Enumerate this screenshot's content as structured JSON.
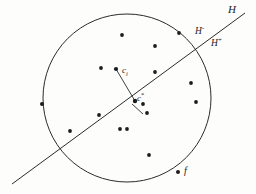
{
  "figure": {
    "background_color": "#fdfdfc",
    "ink_color": "#2b2b2b",
    "width": 256,
    "height": 194
  },
  "labels": {
    "hyperplane": "H",
    "halfspace_negative_base": "H",
    "halfspace_negative_sup": "-",
    "halfspace_positive_base": "H",
    "halfspace_positive_sup": "+",
    "center_i_base": "c",
    "center_i_sub": "i",
    "center_star_base": "c",
    "center_star_sup": "*",
    "facility": "f"
  },
  "geometry": {
    "circle": {
      "cx": 127,
      "cy": 98,
      "r": 84
    },
    "hyperplane_line": {
      "x1": 12,
      "y1": 184,
      "x2": 245,
      "y2": 13
    },
    "normal_segment": {
      "x1": 116,
      "y1": 69,
      "x2": 135,
      "y2": 101
    },
    "perp_tick": {
      "x1": 132,
      "y1": 104,
      "x2": 143,
      "y2": 114
    },
    "label_positions": {
      "hyperplane": {
        "x": 228,
        "y": 6
      },
      "halfspace_negative": {
        "x": 196,
        "y": 27
      },
      "halfspace_positive": {
        "x": 212,
        "y": 39
      },
      "center_i": {
        "x": 120,
        "y": 72
      },
      "center_star": {
        "x": 133,
        "y": 96
      },
      "facility": {
        "x": 183,
        "y": 168
      }
    }
  },
  "chart_data": {
    "type": "scatter",
    "xlabel": "",
    "ylabel": "",
    "xlim": [
      0,
      256
    ],
    "ylim": [
      0,
      194
    ],
    "grid": false,
    "legend": null,
    "annotations": [
      {
        "text": "H",
        "x": 228,
        "y": 6,
        "role": "hyperplane-label"
      },
      {
        "text": "H-",
        "x": 196,
        "y": 27,
        "role": "negative-halfspace-label"
      },
      {
        "text": "H+",
        "x": 212,
        "y": 39,
        "role": "positive-halfspace-label"
      },
      {
        "text": "ci",
        "x": 120,
        "y": 72,
        "role": "center-i-label"
      },
      {
        "text": "c*",
        "x": 133,
        "y": 96,
        "role": "optimal-center-label"
      },
      {
        "text": "f",
        "x": 183,
        "y": 168,
        "role": "facility-label"
      }
    ],
    "shapes": [
      {
        "kind": "circle",
        "cx": 127,
        "cy": 98,
        "r": 84,
        "filled": false
      },
      {
        "kind": "line",
        "x1": 12,
        "y1": 184,
        "x2": 245,
        "y2": 13,
        "name": "hyperplane"
      },
      {
        "kind": "line",
        "x1": 116,
        "y1": 69,
        "x2": 135,
        "y2": 101,
        "name": "normal-segment"
      },
      {
        "kind": "line",
        "x1": 132,
        "y1": 104,
        "x2": 143,
        "y2": 114,
        "name": "perpendicular-tick"
      }
    ],
    "points": [
      {
        "id": "p1",
        "x": 122,
        "y": 35,
        "r": 1.9
      },
      {
        "id": "p2",
        "x": 155,
        "y": 46,
        "r": 1.9
      },
      {
        "id": "p3",
        "x": 179,
        "y": 33,
        "r": 1.9
      },
      {
        "id": "p4",
        "x": 101,
        "y": 68,
        "r": 1.9
      },
      {
        "id": "p5",
        "x": 116,
        "y": 69,
        "r": 2.1
      },
      {
        "id": "p6",
        "x": 155,
        "y": 72,
        "r": 1.9
      },
      {
        "id": "p7",
        "x": 191,
        "y": 83,
        "r": 1.9
      },
      {
        "id": "p8",
        "x": 196,
        "y": 102,
        "r": 1.9
      },
      {
        "id": "p9",
        "x": 42,
        "y": 104,
        "r": 2.0
      },
      {
        "id": "p10",
        "x": 143,
        "y": 104,
        "r": 1.9
      },
      {
        "id": "p11",
        "x": 99,
        "y": 115,
        "r": 1.9
      },
      {
        "id": "p12",
        "x": 147,
        "y": 113,
        "r": 1.9
      },
      {
        "id": "p13",
        "x": 70,
        "y": 131,
        "r": 1.9
      },
      {
        "id": "p14",
        "x": 120,
        "y": 129,
        "r": 1.9
      },
      {
        "id": "p15",
        "x": 127,
        "y": 129,
        "r": 1.9
      },
      {
        "id": "p16",
        "x": 149,
        "y": 155,
        "r": 1.9
      },
      {
        "id": "p17",
        "x": 178,
        "y": 172,
        "r": 2.0
      },
      {
        "id": "p18",
        "x": 135,
        "y": 101,
        "r": 2.2
      }
    ]
  }
}
